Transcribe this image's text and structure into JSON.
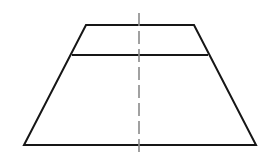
{
  "figure": {
    "name": "trapezoid-with-centerline",
    "canvas": {
      "width": 278,
      "height": 163,
      "background": "#ffffff"
    },
    "colors": {
      "outline": "#161616",
      "divider": "#161616",
      "centerline": "#8a8a8a",
      "background": "#ffffff"
    },
    "shapes": {
      "trapezoid": {
        "label": "trapezoid-outline",
        "stroke_width": 2,
        "closed": true,
        "points": "86,25 194,25 256,145 24,145",
        "vertices": [
          {
            "name": "top-left",
            "x": 86,
            "y": 25
          },
          {
            "name": "top-right",
            "x": 194,
            "y": 25
          },
          {
            "name": "bottom-right",
            "x": 256,
            "y": 145
          },
          {
            "name": "bottom-left",
            "x": 24,
            "y": 145
          }
        ],
        "top_width": 108,
        "bottom_width": 232,
        "height": 120
      },
      "divider": {
        "label": "horizontal-divider-line",
        "stroke_width": 2,
        "x1": 72,
        "y1": 55,
        "x2": 208,
        "y2": 55,
        "length": 136
      },
      "centerline": {
        "label": "vertical-dashed-centerline",
        "stroke_width": 1.6,
        "dash_pattern": "13 5",
        "x1": 139,
        "y1": 13,
        "x2": 139,
        "y2": 156,
        "length": 143
      }
    }
  }
}
